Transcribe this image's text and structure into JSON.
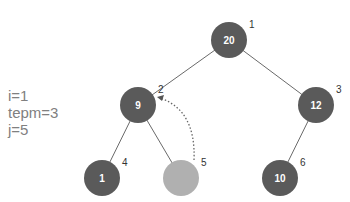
{
  "variables": [
    {
      "text": "i=1"
    },
    {
      "text": "tepm=3"
    },
    {
      "text": "j=5"
    }
  ],
  "tree": {
    "nodes": [
      {
        "index": "1",
        "value": "20",
        "cx": 229,
        "cy": 40,
        "fill": "#5a5a5a"
      },
      {
        "index": "2",
        "value": "9",
        "cx": 138,
        "cy": 105,
        "fill": "#5a5a5a"
      },
      {
        "index": "3",
        "value": "12",
        "cx": 316,
        "cy": 105,
        "fill": "#5a5a5a"
      },
      {
        "index": "4",
        "value": "1",
        "cx": 102,
        "cy": 178,
        "fill": "#5a5a5a"
      },
      {
        "index": "5",
        "value": "",
        "cx": 181,
        "cy": 178,
        "fill": "#b0b0b0"
      },
      {
        "index": "6",
        "value": "10",
        "cx": 280,
        "cy": 178,
        "fill": "#5a5a5a"
      }
    ],
    "edges": [
      [
        0,
        1
      ],
      [
        0,
        2
      ],
      [
        1,
        3
      ],
      [
        1,
        4
      ],
      [
        2,
        5
      ]
    ],
    "arrow": {
      "from": "5",
      "to": "2",
      "style": "dotted"
    }
  }
}
